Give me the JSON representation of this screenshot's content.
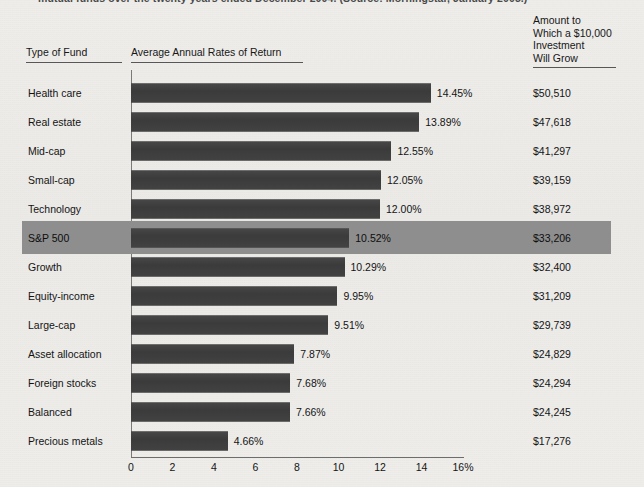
{
  "caption": {
    "text": "mutual funds over the twenty years ended December 2004. (Source: Morningstar, January 2005.)"
  },
  "headers": {
    "type_of_fund": "Type of Fund",
    "rates_of_return": "Average Annual Rates of Return",
    "amount_line1": "Amount to",
    "amount_line2": "Which a $10,000",
    "amount_line3": "Investment",
    "amount_line4": "Will Grow"
  },
  "colors": {
    "background": "#edece9",
    "bar": "#3f3f3f",
    "highlight_band": "#8e8e8e",
    "rule": "#575757"
  },
  "chart_data": {
    "type": "bar",
    "orientation": "horizontal",
    "title": "Average Annual Rates of Return",
    "xlabel": "",
    "ylabel": "Type of Fund",
    "xlim": [
      0,
      16
    ],
    "grid": false,
    "tick_labels": [
      "0",
      "2",
      "4",
      "6",
      "8",
      "10",
      "12",
      "14",
      "16%"
    ],
    "tick_values": [
      0,
      2,
      4,
      6,
      8,
      10,
      12,
      14,
      16
    ],
    "categories": [
      "Health care",
      "Real estate",
      "Mid-cap",
      "Small-cap",
      "Technology",
      "S&P 500",
      "Growth",
      "Equity-income",
      "Large-cap",
      "Asset allocation",
      "Foreign stocks",
      "Balanced",
      "Precious metals"
    ],
    "values": [
      14.45,
      13.89,
      12.55,
      12.05,
      12.0,
      10.52,
      10.29,
      9.95,
      9.51,
      7.87,
      7.68,
      7.66,
      4.66
    ],
    "value_labels": [
      "14.45%",
      "13.89%",
      "12.55%",
      "12.05%",
      "12.00%",
      "10.52%",
      "10.29%",
      "9.95%",
      "9.51%",
      "7.87%",
      "7.68%",
      "7.66%",
      "4.66%"
    ],
    "amount_labels": [
      "$50,510",
      "$47,618",
      "$41,297",
      "$39,159",
      "$38,972",
      "$33,206",
      "$32,400",
      "$31,209",
      "$29,739",
      "$24,829",
      "$24,294",
      "$24,245",
      "$17,276"
    ],
    "highlighted_category": "S&P 500"
  }
}
